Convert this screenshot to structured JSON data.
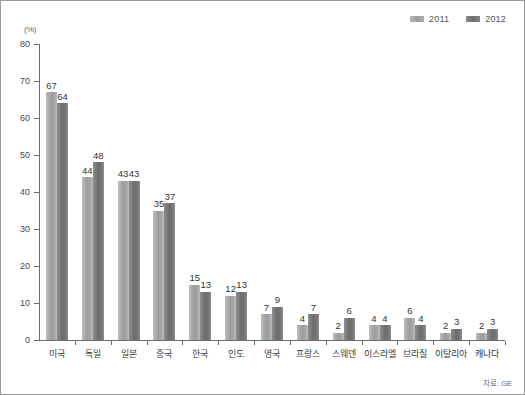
{
  "unit_label": "(%)",
  "source_note": "자료: GE",
  "legend": {
    "position": "top-right",
    "entries": [
      {
        "label": "2011",
        "color": "#a8a8a8",
        "swatch": "swatch-2011"
      },
      {
        "label": "2012",
        "color": "#787878",
        "swatch": "swatch-2012"
      }
    ]
  },
  "chart_data": {
    "type": "bar",
    "title": "",
    "subtitle": "",
    "xlabel": "",
    "ylabel": "(%)",
    "ylim": [
      0,
      80
    ],
    "yticks": [
      "0",
      "10",
      "20",
      "30",
      "40",
      "50",
      "60",
      "70",
      "80"
    ],
    "ytick_values": [
      0,
      10,
      20,
      30,
      40,
      50,
      60,
      70,
      80
    ],
    "grid": false,
    "legend_position": "top-right",
    "categories": [
      "미국",
      "독일",
      "일본",
      "중국",
      "한국",
      "인도",
      "영국",
      "프랑스",
      "스웨덴",
      "이스라엘",
      "브라질",
      "이탈리아",
      "캐나다"
    ],
    "series": [
      {
        "name": "2011",
        "color": "#a8a8a8",
        "values": [
          67,
          44,
          43,
          35,
          15,
          12,
          7,
          4,
          2,
          4,
          6,
          2,
          2
        ]
      },
      {
        "name": "2012",
        "color": "#787878",
        "values": [
          64,
          48,
          43,
          37,
          13,
          13,
          9,
          7,
          6,
          4,
          4,
          3,
          3
        ]
      }
    ],
    "data_labels": [
      {
        "category": "미국",
        "2011": "67",
        "2012": "64"
      },
      {
        "category": "독일",
        "2011": "44",
        "2012": "48"
      },
      {
        "category": "일본",
        "2011": "43",
        "2012": "43"
      },
      {
        "category": "중국",
        "2011": "35",
        "2012": "37"
      },
      {
        "category": "한국",
        "2011": "15",
        "2012": "13"
      },
      {
        "category": "인도",
        "2011": "12",
        "2012": "13"
      },
      {
        "category": "영국",
        "2011": "7",
        "2012": "9"
      },
      {
        "category": "프랑스",
        "2011": "4",
        "2012": "7"
      },
      {
        "category": "스웨덴",
        "2011": "2",
        "2012": "6"
      },
      {
        "category": "이스라엘",
        "2011": "4",
        "2012": "4"
      },
      {
        "category": "브라질",
        "2011": "6",
        "2012": "4"
      },
      {
        "category": "이탈리아",
        "2011": "2",
        "2012": "3"
      },
      {
        "category": "캐나다",
        "2011": "2",
        "2012": "3"
      }
    ]
  }
}
